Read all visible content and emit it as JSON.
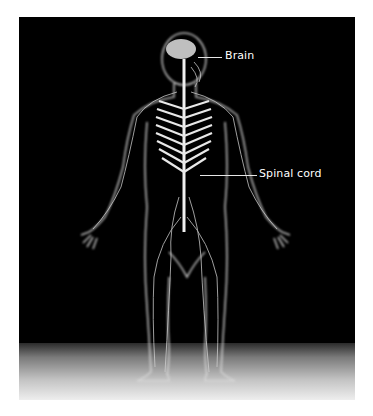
{
  "figure": {
    "background_color": "#000000",
    "labels": [
      {
        "text": "Brain",
        "target": "brain"
      },
      {
        "text": "Spinal cord",
        "target": "spinal-cord"
      }
    ]
  }
}
